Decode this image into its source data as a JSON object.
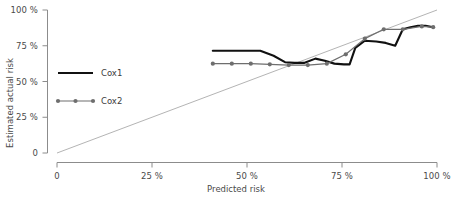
{
  "chart_data": {
    "type": "line",
    "title": "",
    "xlabel": "Predicted risk",
    "ylabel": "Estimated actual risk",
    "xlim": [
      0,
      100
    ],
    "ylim": [
      0,
      100
    ],
    "grid": false,
    "legend_position": "upper-left-inside",
    "xticks": [
      0,
      25,
      50,
      75,
      100
    ],
    "xticklabels": [
      "0",
      "25 %",
      "50 %",
      "75 %",
      "100 %"
    ],
    "yticks": [
      0,
      25,
      50,
      75,
      100
    ],
    "yticklabels": [
      "0",
      "25 %",
      "50 %",
      "75 %",
      "100 %"
    ],
    "reference_line": {
      "name": "diagonal-reference",
      "from": [
        0,
        0
      ],
      "to": [
        100,
        100
      ],
      "color": "#b4b4b4"
    },
    "series": [
      {
        "name": "Cox1",
        "color": "#111111",
        "style": "solid",
        "markers": false,
        "x": [
          41.0,
          45.5,
          50.0,
          53.5,
          57.0,
          60.0,
          62.5,
          65.0,
          68.0,
          70.5,
          73.0,
          75.5,
          77.0,
          78.5,
          81.0,
          84.0,
          86.5,
          89.0,
          91.0,
          93.0,
          95.0,
          97.0,
          99.0
        ],
        "y": [
          71.5,
          71.5,
          71.5,
          71.5,
          68.0,
          63.5,
          63.0,
          63.0,
          66.0,
          64.5,
          62.5,
          62.0,
          62.0,
          73.5,
          78.5,
          78.0,
          77.0,
          75.0,
          86.5,
          88.0,
          89.0,
          89.0,
          88.0
        ]
      },
      {
        "name": "Cox2",
        "color": "#6e6e6e",
        "style": "solid",
        "markers": true,
        "x": [
          41.0,
          46.0,
          51.0,
          56.0,
          61.0,
          66.0,
          71.0,
          76.0,
          81.0,
          86.0,
          91.0,
          96.0,
          99.0
        ],
        "y": [
          62.5,
          62.5,
          62.5,
          62.0,
          61.5,
          61.5,
          62.5,
          69.0,
          80.0,
          86.5,
          86.5,
          88.5,
          88.0
        ]
      }
    ]
  },
  "axes": {
    "y_title": "Estimated actual risk",
    "x_title": "Predicted risk",
    "y_tick_labels": [
      "100 %",
      "75 %",
      "50 %",
      "25 %",
      "0"
    ],
    "x_tick_labels": [
      "0",
      "25 %",
      "50 %",
      "75 %",
      "100 %"
    ]
  },
  "legend": {
    "entries": [
      {
        "label": "Cox1",
        "color": "#111111",
        "marker": false
      },
      {
        "label": "Cox2",
        "color": "#6e6e6e",
        "marker": true
      }
    ]
  },
  "colors": {
    "cox1": "#111111",
    "cox2": "#6e6e6e",
    "reference": "#b4b4b4",
    "axis": "#8c8c8c",
    "text": "#3b3b3b",
    "background": "#ffffff"
  }
}
